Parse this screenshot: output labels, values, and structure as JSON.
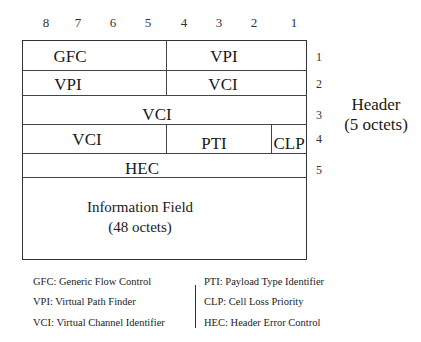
{
  "diagram": {
    "bit_numbers": [
      "8",
      "7",
      "6",
      "5",
      "4",
      "3",
      "2",
      "1"
    ],
    "rows": [
      {
        "octet": "1",
        "fields": [
          {
            "label": "GFC",
            "bits": "8-5"
          },
          {
            "label": "VPI",
            "bits": "4-1"
          }
        ]
      },
      {
        "octet": "2",
        "fields": [
          {
            "label": "VPI",
            "bits": "8-5"
          },
          {
            "label": "VCI",
            "bits": "4-1"
          }
        ]
      },
      {
        "octet": "3",
        "fields": [
          {
            "label": "VCI",
            "bits": "8-1"
          }
        ]
      },
      {
        "octet": "4",
        "fields": [
          {
            "label": "VCI",
            "bits": "8-5"
          },
          {
            "label": "PTI",
            "bits": "4-2"
          },
          {
            "label": "CLP",
            "bits": "1"
          }
        ]
      },
      {
        "octet": "5",
        "fields": [
          {
            "label": "HEC",
            "bits": "8-1"
          }
        ]
      }
    ],
    "header_label": {
      "line1": "Header",
      "line2": "(5 octets)"
    },
    "information_field": {
      "line1": "Information Field",
      "line2": "(48 octets)"
    }
  },
  "legend": {
    "left": [
      "GFC: Generic Flow Control",
      "VPI: Virtual Path Finder",
      "VCI: Virtual Channel Identifier"
    ],
    "right": [
      "PTI: Payload Type Identifier",
      "CLP: Cell Loss Priority",
      "HEC: Header Error Control"
    ]
  }
}
